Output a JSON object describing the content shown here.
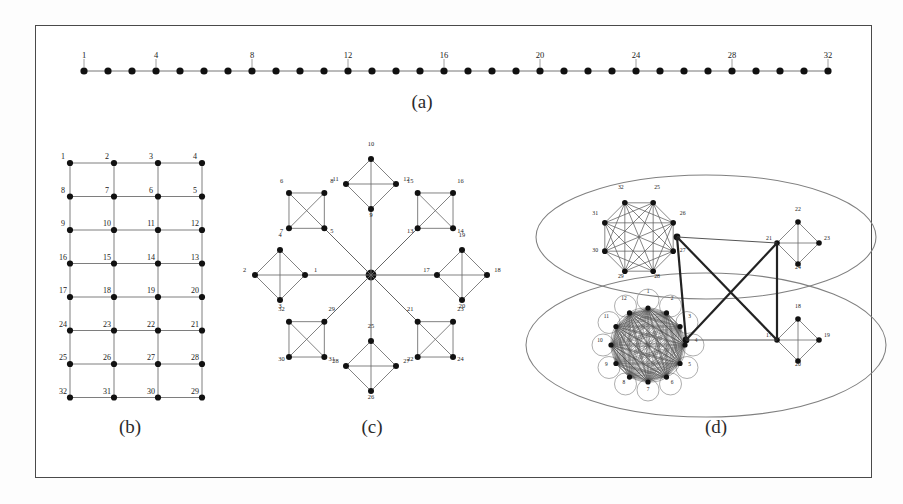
{
  "figure": {
    "background": "#ffffff",
    "frame_color": "#4a4a4a",
    "node_color": "#111111",
    "edge_color": "#555555",
    "label_color": "#1a1a1a"
  },
  "panels": [
    {
      "id": "a",
      "caption": "(a)",
      "type": "path-graph",
      "description": "linear chain of 32 nodes",
      "node_count": 32,
      "labeled_nodes": [
        1,
        4,
        8,
        12,
        16,
        20,
        24,
        28,
        32
      ],
      "labels": [
        "1",
        "4",
        "8",
        "12",
        "16",
        "20",
        "24",
        "28",
        "32"
      ],
      "caption_xy": [
        422,
        108
      ]
    },
    {
      "id": "b",
      "caption": "(b)",
      "type": "grid-graph",
      "description": "4 by 8 mesh with boustrophedon numbering",
      "cols": 4,
      "rows": 8,
      "node_count": 32,
      "rows_labels": [
        [
          "1",
          "2",
          "3",
          "4"
        ],
        [
          "8",
          "7",
          "6",
          "5"
        ],
        [
          "9",
          "10",
          "11",
          "12"
        ],
        [
          "16",
          "15",
          "14",
          "13"
        ],
        [
          "17",
          "18",
          "19",
          "20"
        ],
        [
          "24",
          "23",
          "22",
          "21"
        ],
        [
          "25",
          "26",
          "27",
          "28"
        ],
        [
          "32",
          "31",
          "30",
          "29"
        ]
      ],
      "caption_xy": [
        130,
        433
      ]
    },
    {
      "id": "c",
      "caption": "(c)",
      "type": "star-of-cliques",
      "description": "central hub joined to eight K4 diamonds",
      "arm_count": 8,
      "clique_size": 4,
      "node_count": 32,
      "arms": [
        {
          "dir": "W",
          "labels": [
            "1",
            "4",
            "2",
            "3"
          ]
        },
        {
          "dir": "NW",
          "labels": [
            "5",
            "8",
            "6",
            "7"
          ]
        },
        {
          "dir": "N",
          "labels": [
            "9",
            "12",
            "10",
            "11"
          ]
        },
        {
          "dir": "NE",
          "labels": [
            "13",
            "14",
            "16",
            "15"
          ]
        },
        {
          "dir": "E",
          "labels": [
            "17",
            "20",
            "18",
            "19"
          ]
        },
        {
          "dir": "SE",
          "labels": [
            "21",
            "22",
            "24",
            "23"
          ]
        },
        {
          "dir": "S",
          "labels": [
            "25",
            "28",
            "26",
            "27"
          ]
        },
        {
          "dir": "SW",
          "labels": [
            "29",
            "32",
            "30",
            "31"
          ]
        }
      ],
      "caption_xy": [
        372,
        433
      ]
    },
    {
      "id": "d",
      "caption": "(d)",
      "type": "two-cluster-graph",
      "description": "two ellipse groups, each holding a dense clique and a K4 diamond, cross linked",
      "node_count": 32,
      "groups": [
        {
          "name": "top-ellipse",
          "dense_clique": {
            "kind": "K8",
            "node_count": 8,
            "labels": [
              "25",
              "26",
              "27",
              "28",
              "29",
              "30",
              "31",
              "32"
            ]
          },
          "diamond": {
            "labels": [
              "21",
              "22",
              "23",
              "24"
            ]
          }
        },
        {
          "name": "bottom-ellipse",
          "dense_clique": {
            "kind": "dense-multigraph",
            "node_count": 12,
            "labels": [
              "1",
              "2",
              "3",
              "4",
              "5",
              "6",
              "7",
              "8",
              "9",
              "10",
              "11",
              "12"
            ]
          },
          "diamond": {
            "labels": [
              "17",
              "18",
              "19",
              "20"
            ]
          }
        }
      ],
      "cross_links": 4,
      "caption_xy": [
        716,
        433
      ]
    }
  ]
}
